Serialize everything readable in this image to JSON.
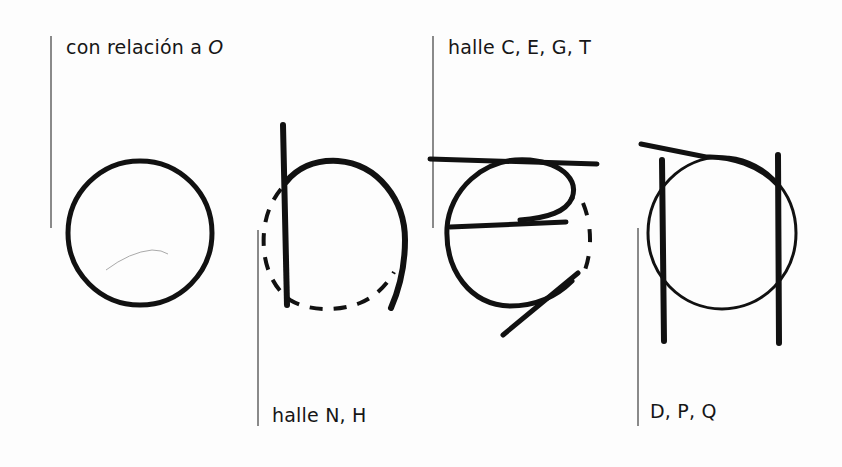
{
  "figure": {
    "captions": {
      "o": {
        "text": "con relación a ",
        "italic_suffix": "O"
      },
      "n_h": {
        "text": "halle N, H"
      },
      "c_e_g_t": {
        "text": "halle C, E, G, T"
      },
      "d_p_q": {
        "text": "D, P, Q"
      }
    },
    "glyphs": [
      {
        "id": "circle-o",
        "description": "Basic circle O"
      },
      {
        "id": "n-h-construction",
        "description": "Circle with vertical stem, dashed lower half"
      },
      {
        "id": "c-e-g-t-construction",
        "description": "Circle with top bar, middle bar and diagonal tail, dashed right side"
      },
      {
        "id": "d-p-q-construction",
        "description": "Circle between two vertical stems with slanted top stroke"
      }
    ],
    "colors": {
      "ink": "#111111",
      "rule": "#8a8a8a",
      "background": "#fdfdfd"
    }
  }
}
